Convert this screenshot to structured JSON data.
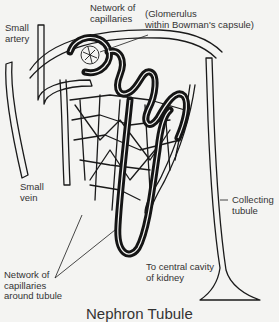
{
  "diagram": {
    "labels": {
      "network_capillaries_top": "Network of\ncapillaries",
      "glomerulus": "(Glomerulus\nwithin Bowman's capsule)",
      "small_artery": "Small\nartery",
      "small_vein": "Small\nvein",
      "collecting_tubule": "Collecting\ntubule",
      "network_capillaries_tubule": "Network of\ncapillaries\naround tubule",
      "central_cavity": "To central cavity\nof kidney"
    },
    "caption": "Nephron Tubule",
    "colors": {
      "ink": "#1a1a1a",
      "background": "#f4f4f2"
    }
  }
}
